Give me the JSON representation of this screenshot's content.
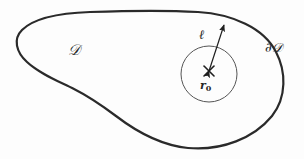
{
  "figure": {
    "kind": "math-diagram",
    "background_color": "#fdfdfd",
    "stroke_color": "#2a2a2a",
    "thin_stroke_color": "#555555",
    "text_color": "#262626",
    "width": 304,
    "height": 159
  },
  "labels": {
    "domain": "𝒟",
    "boundary": "∂𝒟",
    "radius": "ℓ",
    "point_base": "r",
    "point_sub": "0"
  },
  "geometry": {
    "blob": {
      "name": "domain-outline",
      "stroke_width": 2.2,
      "extent_left": 16,
      "extent_top": 11,
      "extent_right": 283,
      "extent_bottom": 148,
      "path": "M 90 12 C 62 13 34 18 22 30 C 13 39 16 52 27 62 C 40 74 58 81 74 89 C 92 98 104 107 116 116 C 133 129 158 145 188 148 C 222 151 254 138 272 116 C 287 97 286 71 276 52 C 264 28 232 14 198 12 C 162 10 120 11 90 12 Z"
    },
    "circle": {
      "name": "small-circle",
      "cx": 209,
      "cy": 74,
      "r": 28,
      "stroke_width": 1.0
    },
    "cross": {
      "name": "center-cross",
      "cx": 209,
      "cy": 71,
      "half": 5,
      "stroke_width": 1.6
    },
    "arrow": {
      "name": "radius-arrow",
      "x1": 209,
      "y1": 71,
      "x2": 224,
      "y2": 25,
      "stroke_width": 1.2,
      "double_headed": true
    }
  }
}
